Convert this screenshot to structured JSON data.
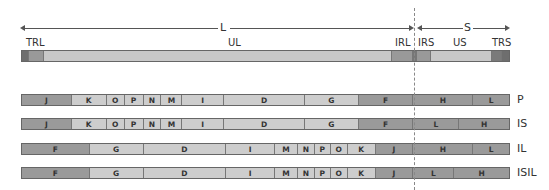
{
  "colors": {
    "dark": "#7a7a7a",
    "medium": "#9c9c9c",
    "light": "#c8c8c8",
    "verydark": "#6a6a6a"
  },
  "top": {
    "L_label": "L",
    "S_label": "S",
    "labels": {
      "TRL": "TRL",
      "UL": "UL",
      "IRL": "IRL",
      "IRS": "IRS",
      "US": "US",
      "TRS": "TRS"
    }
  },
  "rows": [
    {
      "label": "P",
      "segments": [
        {
          "t": "J",
          "x": 21,
          "w": 50,
          "c": "medium"
        },
        {
          "t": "K",
          "x": 71,
          "w": 35,
          "c": "light"
        },
        {
          "t": "O",
          "x": 106,
          "w": 18,
          "c": "light"
        },
        {
          "t": "P",
          "x": 124,
          "w": 19,
          "c": "light"
        },
        {
          "t": "N",
          "x": 143,
          "w": 18,
          "c": "light"
        },
        {
          "t": "M",
          "x": 161,
          "w": 21,
          "c": "light"
        },
        {
          "t": "I",
          "x": 182,
          "w": 42,
          "c": "light"
        },
        {
          "t": "D",
          "x": 224,
          "w": 81,
          "c": "light"
        },
        {
          "t": "G",
          "x": 305,
          "w": 54,
          "c": "light"
        },
        {
          "t": "F",
          "x": 359,
          "w": 55,
          "c": "medium"
        },
        {
          "t": "H",
          "x": 414,
          "w": 60,
          "c": "medium"
        },
        {
          "t": "L",
          "x": 474,
          "w": 36,
          "c": "medium"
        }
      ]
    },
    {
      "label": "IS",
      "segments": [
        {
          "t": "J",
          "x": 21,
          "w": 50,
          "c": "medium"
        },
        {
          "t": "K",
          "x": 71,
          "w": 35,
          "c": "light"
        },
        {
          "t": "O",
          "x": 106,
          "w": 18,
          "c": "light"
        },
        {
          "t": "P",
          "x": 124,
          "w": 19,
          "c": "light"
        },
        {
          "t": "N",
          "x": 143,
          "w": 18,
          "c": "light"
        },
        {
          "t": "M",
          "x": 161,
          "w": 21,
          "c": "light"
        },
        {
          "t": "I",
          "x": 182,
          "w": 42,
          "c": "light"
        },
        {
          "t": "D",
          "x": 224,
          "w": 81,
          "c": "light"
        },
        {
          "t": "G",
          "x": 305,
          "w": 54,
          "c": "light"
        },
        {
          "t": "F",
          "x": 359,
          "w": 55,
          "c": "medium"
        },
        {
          "t": "L",
          "x": 414,
          "w": 46,
          "c": "medium"
        },
        {
          "t": "H",
          "x": 460,
          "w": 50,
          "c": "medium"
        }
      ]
    },
    {
      "label": "IL",
      "segments": [
        {
          "t": "F",
          "x": 21,
          "w": 68,
          "c": "medium"
        },
        {
          "t": "G",
          "x": 89,
          "w": 54,
          "c": "light"
        },
        {
          "t": "D",
          "x": 143,
          "w": 83,
          "c": "light"
        },
        {
          "t": "I",
          "x": 226,
          "w": 49,
          "c": "light"
        },
        {
          "t": "M",
          "x": 275,
          "w": 23,
          "c": "light"
        },
        {
          "t": "N",
          "x": 298,
          "w": 17,
          "c": "light"
        },
        {
          "t": "P",
          "x": 315,
          "w": 16,
          "c": "light"
        },
        {
          "t": "O",
          "x": 331,
          "w": 17,
          "c": "light"
        },
        {
          "t": "K",
          "x": 348,
          "w": 28,
          "c": "light"
        },
        {
          "t": "J",
          "x": 376,
          "w": 38,
          "c": "medium"
        },
        {
          "t": "H",
          "x": 414,
          "w": 60,
          "c": "medium"
        },
        {
          "t": "L",
          "x": 474,
          "w": 36,
          "c": "medium"
        }
      ]
    },
    {
      "label": "ISIL",
      "segments": [
        {
          "t": "F",
          "x": 21,
          "w": 68,
          "c": "medium"
        },
        {
          "t": "G",
          "x": 89,
          "w": 54,
          "c": "light"
        },
        {
          "t": "D",
          "x": 143,
          "w": 83,
          "c": "light"
        },
        {
          "t": "I",
          "x": 226,
          "w": 49,
          "c": "light"
        },
        {
          "t": "M",
          "x": 275,
          "w": 23,
          "c": "light"
        },
        {
          "t": "N",
          "x": 298,
          "w": 17,
          "c": "light"
        },
        {
          "t": "P",
          "x": 315,
          "w": 16,
          "c": "light"
        },
        {
          "t": "O",
          "x": 331,
          "w": 17,
          "c": "light"
        },
        {
          "t": "K",
          "x": 348,
          "w": 28,
          "c": "light"
        },
        {
          "t": "J",
          "x": 376,
          "w": 38,
          "c": "medium"
        },
        {
          "t": "L",
          "x": 414,
          "w": 41,
          "c": "medium"
        },
        {
          "t": "H",
          "x": 455,
          "w": 55,
          "c": "medium"
        }
      ]
    }
  ]
}
